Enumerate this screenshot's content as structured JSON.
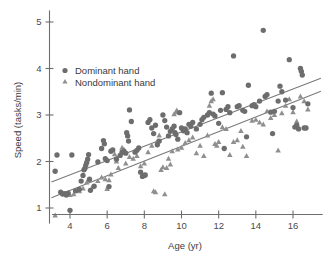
{
  "chart_data": {
    "type": "scatter",
    "title": "",
    "xlabel": "Age (yr)",
    "ylabel": "Speed (tasks/min)",
    "xlim": [
      2.6,
      17.6
    ],
    "ylim": [
      0.75,
      5.25
    ],
    "xticks": [
      4,
      6,
      8,
      10,
      12,
      14,
      16
    ],
    "yticks": [
      1,
      2,
      3,
      4,
      5
    ],
    "xtick_labels": [
      "4",
      "6",
      "8",
      "10",
      "12",
      "14",
      "16"
    ],
    "ytick_labels": [
      "1",
      "2",
      "3",
      "4",
      "5"
    ],
    "grid": false,
    "legend_position": "upper-left",
    "marker_color_dominant": "#6d6d6d",
    "marker_color_nondominant": "#8f8f8f",
    "fit_line_color": "#7a7a7a",
    "series": [
      {
        "name": "Dominant hand",
        "marker": "circle",
        "fit_line": {
          "x": [
            3.0,
            17.5
          ],
          "y": [
            1.56,
            3.79
          ]
        },
        "points": [
          [
            3.2,
            1.79
          ],
          [
            3.3,
            2.14
          ],
          [
            3.5,
            1.34
          ],
          [
            3.6,
            1.3
          ],
          [
            3.7,
            1.31
          ],
          [
            3.8,
            1.28
          ],
          [
            3.9,
            1.32
          ],
          [
            4.0,
            0.95
          ],
          [
            4.1,
            2.14
          ],
          [
            4.3,
            1.37
          ],
          [
            4.5,
            1.4
          ],
          [
            4.6,
            1.58
          ],
          [
            4.7,
            1.7
          ],
          [
            4.75,
            1.82
          ],
          [
            4.8,
            1.85
          ],
          [
            4.85,
            1.92
          ],
          [
            4.9,
            1.98
          ],
          [
            4.95,
            2.05
          ],
          [
            5.0,
            2.15
          ],
          [
            5.05,
            1.62
          ],
          [
            5.1,
            1.38
          ],
          [
            5.3,
            1.47
          ],
          [
            5.5,
            1.99
          ],
          [
            5.7,
            2.28
          ],
          [
            5.8,
            2.45
          ],
          [
            5.85,
            2.38
          ],
          [
            5.9,
            2.06
          ],
          [
            6.0,
            2.02
          ],
          [
            6.1,
            1.46
          ],
          [
            6.2,
            2.22
          ],
          [
            6.3,
            2.25
          ],
          [
            6.5,
            2.05
          ],
          [
            6.7,
            2.13
          ],
          [
            6.8,
            2.2
          ],
          [
            6.9,
            2.22
          ],
          [
            7.0,
            2.18
          ],
          [
            7.05,
            2.62
          ],
          [
            7.1,
            2.55
          ],
          [
            7.15,
            2.44
          ],
          [
            7.2,
            3.11
          ],
          [
            7.3,
            2.86
          ],
          [
            7.5,
            2.2
          ],
          [
            7.6,
            2.24
          ],
          [
            7.7,
            2.29
          ],
          [
            7.8,
            1.77
          ],
          [
            7.9,
            1.68
          ],
          [
            8.0,
            1.7
          ],
          [
            8.05,
            1.71
          ],
          [
            8.2,
            2.84
          ],
          [
            8.3,
            2.9
          ],
          [
            8.4,
            2.72
          ],
          [
            8.5,
            2.6
          ],
          [
            8.6,
            2.78
          ],
          [
            8.7,
            2.36
          ],
          [
            8.8,
            2.44
          ],
          [
            9.0,
            3.0
          ],
          [
            9.1,
            2.88
          ],
          [
            9.2,
            2.74
          ],
          [
            9.3,
            2.55
          ],
          [
            9.4,
            2.65
          ],
          [
            9.5,
            2.7
          ],
          [
            9.6,
            2.76
          ],
          [
            9.65,
            2.62
          ],
          [
            9.7,
            2.58
          ],
          [
            9.8,
            2.48
          ],
          [
            9.9,
            3.05
          ],
          [
            10.0,
            2.72
          ],
          [
            10.1,
            2.66
          ],
          [
            10.2,
            2.7
          ],
          [
            10.3,
            2.62
          ],
          [
            10.4,
            2.8
          ],
          [
            10.5,
            2.76
          ],
          [
            10.6,
            2.84
          ],
          [
            10.8,
            2.7
          ],
          [
            11.0,
            2.8
          ],
          [
            11.1,
            2.9
          ],
          [
            11.2,
            2.95
          ],
          [
            11.4,
            3.0
          ],
          [
            11.5,
            3.05
          ],
          [
            11.6,
            3.47
          ],
          [
            11.7,
            3.02
          ],
          [
            11.8,
            2.98
          ],
          [
            12.0,
            2.82
          ],
          [
            12.1,
            3.1
          ],
          [
            12.2,
            3.48
          ],
          [
            12.3,
            2.28
          ],
          [
            12.4,
            3.12
          ],
          [
            12.5,
            3.18
          ],
          [
            12.6,
            3.05
          ],
          [
            12.8,
            4.27
          ],
          [
            13.0,
            3.18
          ],
          [
            13.1,
            3.2
          ],
          [
            13.3,
            3.1
          ],
          [
            13.4,
            3.08
          ],
          [
            13.5,
            2.53
          ],
          [
            13.6,
            3.64
          ],
          [
            13.8,
            3.2
          ],
          [
            13.9,
            3.22
          ],
          [
            14.0,
            3.18
          ],
          [
            14.2,
            3.3
          ],
          [
            14.4,
            4.82
          ],
          [
            14.5,
            3.4
          ],
          [
            14.6,
            3.44
          ],
          [
            14.8,
            3.06
          ],
          [
            14.9,
            2.6
          ],
          [
            15.0,
            3.08
          ],
          [
            15.2,
            3.3
          ],
          [
            15.3,
            3.62
          ],
          [
            15.4,
            3.5
          ],
          [
            15.6,
            3.32
          ],
          [
            15.8,
            4.19
          ],
          [
            16.0,
            3.16
          ],
          [
            16.1,
            2.74
          ],
          [
            16.2,
            2.78
          ],
          [
            16.3,
            2.7
          ],
          [
            16.4,
            4.0
          ],
          [
            16.45,
            3.94
          ],
          [
            16.5,
            3.86
          ],
          [
            16.6,
            2.72
          ],
          [
            16.7,
            2.72
          ],
          [
            16.8,
            3.24
          ]
        ]
      },
      {
        "name": "Nondominant hand",
        "marker": "triangle",
        "fit_line": {
          "x": [
            3.0,
            17.5
          ],
          "y": [
            1.22,
            3.51
          ]
        },
        "points": [
          [
            3.2,
            0.84
          ],
          [
            4.0,
            1.28
          ],
          [
            4.2,
            1.3
          ],
          [
            4.5,
            1.36
          ],
          [
            4.7,
            1.42
          ],
          [
            4.9,
            1.55
          ],
          [
            5.0,
            1.6
          ],
          [
            5.2,
            1.45
          ],
          [
            5.5,
            1.58
          ],
          [
            5.7,
            1.66
          ],
          [
            5.9,
            1.62
          ],
          [
            6.0,
            1.41
          ],
          [
            6.05,
            1.46
          ],
          [
            6.1,
            1.6
          ],
          [
            6.2,
            1.72
          ],
          [
            6.4,
            2.16
          ],
          [
            6.5,
            2.0
          ],
          [
            6.6,
            1.86
          ],
          [
            6.8,
            2.3
          ],
          [
            6.9,
            2.26
          ],
          [
            7.0,
            1.96
          ],
          [
            7.2,
            2.1
          ],
          [
            7.4,
            2.06
          ],
          [
            7.6,
            2.12
          ],
          [
            7.8,
            1.9
          ],
          [
            8.0,
            1.96
          ],
          [
            8.2,
            2.2
          ],
          [
            8.4,
            2.34
          ],
          [
            8.5,
            1.36
          ],
          [
            8.6,
            1.34
          ],
          [
            8.7,
            2.44
          ],
          [
            8.8,
            2.56
          ],
          [
            8.9,
            1.82
          ],
          [
            9.0,
            1.88
          ],
          [
            9.1,
            1.3
          ],
          [
            9.2,
            1.86
          ],
          [
            9.3,
            2.06
          ],
          [
            9.4,
            1.94
          ],
          [
            9.5,
            2.22
          ],
          [
            9.6,
            3.02
          ],
          [
            9.7,
            3.06
          ],
          [
            9.75,
            3.1
          ],
          [
            9.8,
            2.26
          ],
          [
            10.0,
            2.3
          ],
          [
            10.2,
            2.4
          ],
          [
            10.4,
            2.46
          ],
          [
            10.6,
            2.52
          ],
          [
            10.8,
            2.18
          ],
          [
            11.0,
            2.34
          ],
          [
            11.2,
            2.12
          ],
          [
            11.4,
            2.56
          ],
          [
            11.5,
            3.2
          ],
          [
            11.6,
            3.3
          ],
          [
            11.7,
            3.34
          ],
          [
            11.8,
            2.38
          ],
          [
            11.9,
            2.34
          ],
          [
            12.0,
            2.42
          ],
          [
            12.2,
            2.74
          ],
          [
            12.4,
            2.7
          ],
          [
            12.6,
            2.14
          ],
          [
            12.8,
            2.42
          ],
          [
            13.0,
            2.46
          ],
          [
            13.2,
            2.66
          ],
          [
            13.3,
            2.32
          ],
          [
            13.5,
            2.12
          ],
          [
            13.8,
            2.88
          ],
          [
            14.0,
            2.9
          ],
          [
            14.2,
            2.84
          ],
          [
            14.4,
            2.8
          ],
          [
            14.6,
            3.08
          ],
          [
            14.8,
            2.94
          ],
          [
            15.0,
            3.0
          ],
          [
            15.2,
            2.24
          ],
          [
            15.4,
            3.04
          ],
          [
            15.6,
            3.2
          ],
          [
            15.8,
            3.34
          ],
          [
            16.0,
            3.06
          ],
          [
            16.2,
            2.86
          ],
          [
            16.4,
            3.4
          ],
          [
            16.6,
            3.3
          ],
          [
            16.8,
            3.12
          ]
        ]
      }
    ]
  },
  "legend": {
    "items": [
      {
        "label": "Dominant hand",
        "marker": "circle"
      },
      {
        "label": "Nondominant hand",
        "marker": "triangle"
      }
    ]
  },
  "axes": {
    "x_title": "Age (yr)",
    "y_title": "Speed (tasks/min)"
  }
}
